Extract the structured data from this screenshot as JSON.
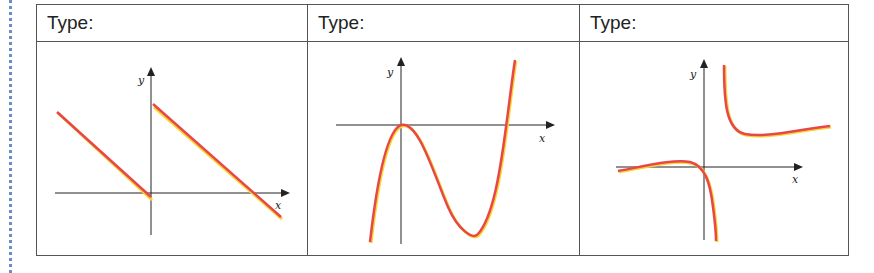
{
  "worksheet": {
    "columns": [
      {
        "header": "Type:",
        "graph": "piecewise-linear",
        "description": "Two parallel decreasing line segments; left segment ends at origin, right segment starts on positive y-axis and crosses x-axis"
      },
      {
        "header": "Type:",
        "graph": "cubic",
        "description": "Cubic curve with local max at origin touching x-axis, local min below, crossing x-axis on the right"
      },
      {
        "header": "Type:",
        "graph": "rational",
        "description": "Rational function with vertical asymptote right of y-axis; branch through origin going down, upper right branch with horizontal trend"
      }
    ],
    "axis_labels": {
      "x": "x",
      "y": "y"
    },
    "colors": {
      "curve": "#e8474a",
      "curve_highlight": "#f7d531",
      "axis": "#222222",
      "border": "#555555"
    }
  }
}
